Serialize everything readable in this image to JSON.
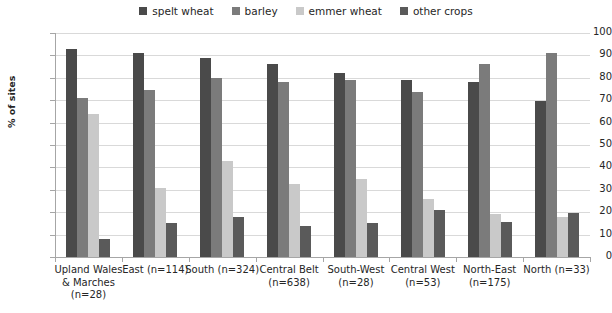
{
  "chart_data": {
    "type": "bar",
    "title": "",
    "xlabel": "",
    "ylabel": "% of sites",
    "ylim": [
      0,
      100
    ],
    "ytick_step": 10,
    "ytick_labels": [
      "0",
      "10",
      "20",
      "30",
      "40",
      "50",
      "60",
      "70",
      "80",
      "90",
      "100"
    ],
    "grid": true,
    "legend_position": "top-center",
    "categories": [
      "Upland Wales & Marches (n=28)",
      "East (n=114)",
      "South (n=324)",
      "Central Belt (n=638)",
      "South-West (n=28)",
      "Central West (n=53)",
      "North-East (n=175)",
      "North (n=33)"
    ],
    "category_lines": [
      [
        "Upland Wales",
        "& Marches",
        "(n=28)"
      ],
      [
        "East (n=114)"
      ],
      [
        "South (n=324)"
      ],
      [
        "Central Belt",
        "(n=638)"
      ],
      [
        "South-West",
        "(n=28)"
      ],
      [
        "Central West",
        "(n=53)"
      ],
      [
        "North-East",
        "(n=175)"
      ],
      [
        "North (n=33)"
      ]
    ],
    "series": [
      {
        "name": "spelt wheat",
        "color": "#4a4a4a",
        "values": [
          93,
          91,
          89,
          86,
          82,
          79,
          78,
          69.5
        ]
      },
      {
        "name": "barley",
        "color": "#7b7b7b",
        "values": [
          71,
          74.5,
          80,
          78,
          79,
          73.5,
          86,
          91
        ]
      },
      {
        "name": "emmer wheat",
        "color": "#c9c9c9",
        "values": [
          64,
          31,
          43,
          32.5,
          35,
          26,
          19,
          18
        ]
      },
      {
        "name": "other crops",
        "color": "#5a5a5a",
        "values": [
          8,
          15,
          18,
          14,
          15,
          21,
          15.5,
          19.5
        ]
      }
    ]
  }
}
